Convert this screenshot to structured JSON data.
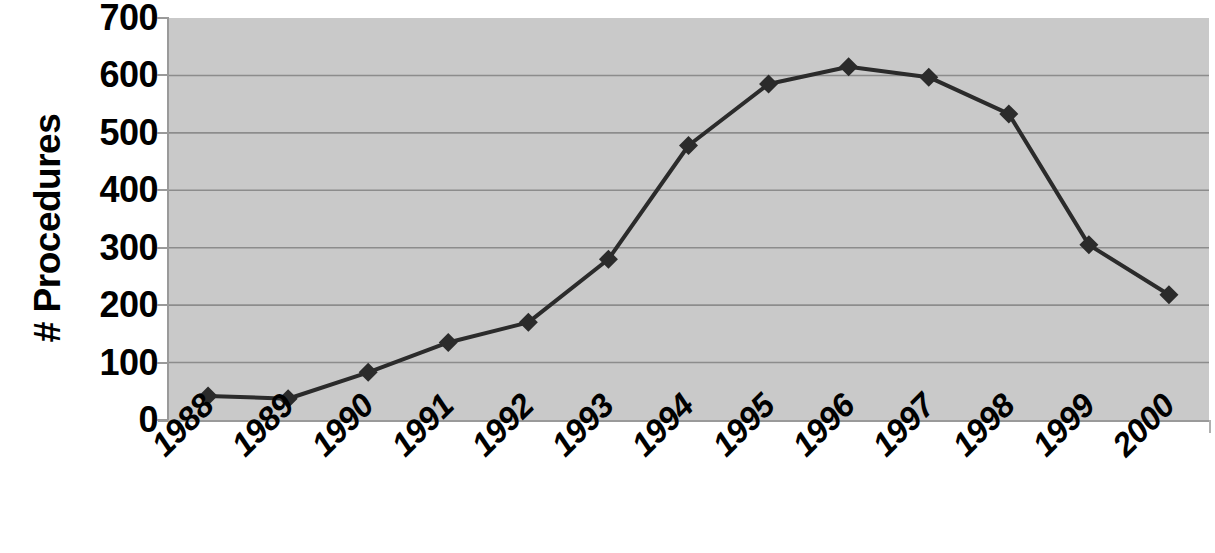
{
  "chart_data": {
    "type": "line",
    "title": "",
    "subtitle": "",
    "xlabel": "",
    "ylabel": "# Procedures",
    "categories": [
      "1988",
      "1989",
      "1990",
      "1991",
      "1992",
      "1993",
      "1994",
      "1995",
      "1996",
      "1997",
      "1998",
      "1999",
      "2000"
    ],
    "values": [
      42,
      37,
      83,
      135,
      170,
      280,
      478,
      585,
      615,
      597,
      533,
      305,
      218
    ],
    "series": [
      {
        "name": "# Procedures",
        "values": [
          42,
          37,
          83,
          135,
          170,
          280,
          478,
          585,
          615,
          597,
          533,
          305,
          218
        ]
      }
    ],
    "ylim": [
      0,
      700
    ],
    "y_ticks": [
      "0",
      "100",
      "200",
      "300",
      "400",
      "500",
      "600",
      "700"
    ],
    "y_tick_values": [
      0,
      100,
      200,
      300,
      400,
      500,
      600,
      700
    ],
    "grid": true,
    "grid_axis": "y",
    "legend": false,
    "legend_position": "none",
    "marker": "diamond",
    "marker_color": "#2b2b2b",
    "line_color": "#2b2b2b",
    "plot_background": "#c9c9c9",
    "figure_background": "#ffffff",
    "gridline_color": "#8c8c8c",
    "x_label_rotation": -45
  },
  "axes": {
    "y_title": "# Procedures"
  }
}
